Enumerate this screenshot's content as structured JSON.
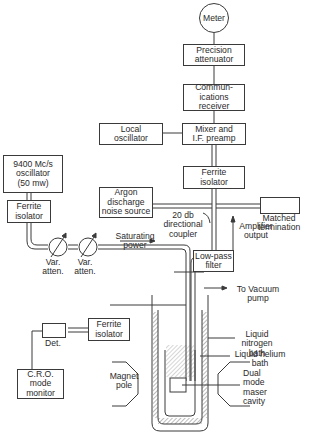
{
  "diagram": {
    "type": "block-diagram",
    "nodes": {
      "meter": "Meter",
      "precision_attenuator": "Precision\nattenuator",
      "communications_receiver": "Commun-\nications\nreceiver",
      "local_oscillator": "Local\noscillator",
      "mixer": "Mixer and\nI.F. preamp",
      "ferrite_isolator_top": "Ferrite\nisolator",
      "argon_source": "Argon\ndischarge\nnoise source",
      "matched_termination": "Matched\ntermination",
      "oscillator": "9400 Mc/s\noscillator\n(50 mw)",
      "ferrite_isolator_left": "Ferrite\nisolator",
      "low_pass_filter": "Low-pass\nfilter",
      "ferrite_isolator_bottom": "Ferrite\nisolator",
      "cro_monitor": "C.R.O.\nmode\nmonitor"
    },
    "labels": {
      "directional_coupler": "20 db\ndirectional\ncoupler",
      "amplifier_output": "Amplifier\noutput",
      "var_atten_1": "Var.\natten.",
      "var_atten_2": "Var.\natten.",
      "saturating_power": "Saturating\npower",
      "vacuum_pump": "To Vacuum\npump",
      "detector": "Det.",
      "liquid_nitrogen": "Liquid\nnitrogen\nbath",
      "liquid_helium": "Liquid helium\nbath",
      "magnet_pole": "Magnet\npole",
      "maser_cavity": "Dual\nmode\nmaser\ncavity"
    },
    "edges": [
      [
        "meter",
        "precision_attenuator"
      ],
      [
        "precision_attenuator",
        "communications_receiver"
      ],
      [
        "communications_receiver",
        "mixer"
      ],
      [
        "local_oscillator",
        "mixer"
      ],
      [
        "mixer",
        "ferrite_isolator_top"
      ],
      [
        "ferrite_isolator_top",
        "directional_coupler"
      ],
      [
        "argon_source",
        "directional_coupler"
      ],
      [
        "directional_coupler",
        "matched_termination"
      ],
      [
        "directional_coupler",
        "low_pass_filter"
      ],
      [
        "low_pass_filter",
        "maser_cavity"
      ],
      [
        "oscillator",
        "ferrite_isolator_left"
      ],
      [
        "ferrite_isolator_left",
        "var_atten_1"
      ],
      [
        "var_atten_1",
        "var_atten_2"
      ],
      [
        "var_atten_2",
        "maser_cavity"
      ],
      [
        "maser_cavity",
        "ferrite_isolator_bottom"
      ],
      [
        "ferrite_isolator_bottom",
        "detector"
      ],
      [
        "detector",
        "cro_monitor"
      ]
    ]
  }
}
